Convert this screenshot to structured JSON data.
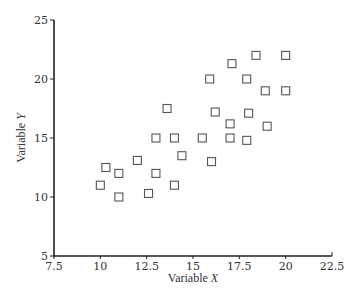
{
  "chart_data": {
    "type": "scatter",
    "title": "",
    "xlabel": "Variable X",
    "xlabel_parts": {
      "prefix": "Variable ",
      "var": "X"
    },
    "ylabel": "Variable Y",
    "ylabel_parts": {
      "prefix": "Variable ",
      "var": "Y"
    },
    "xlim": [
      7.5,
      22.5
    ],
    "ylim": [
      5,
      25
    ],
    "xticks": [
      7.5,
      10,
      12.5,
      15,
      17.5,
      20,
      22.5
    ],
    "xtick_labels": [
      "7.5",
      "10",
      "12.5",
      "15",
      "17.5",
      "20",
      "22.5"
    ],
    "yticks": [
      5,
      10,
      15,
      20,
      25
    ],
    "ytick_labels": [
      "5",
      "10",
      "15",
      "20",
      "25"
    ],
    "grid": false,
    "legend": null,
    "marker": "open-square",
    "series": [
      {
        "name": "observations",
        "points": [
          {
            "x": 10.0,
            "y": 11.0
          },
          {
            "x": 10.3,
            "y": 12.5
          },
          {
            "x": 11.0,
            "y": 12.0
          },
          {
            "x": 11.0,
            "y": 10.0
          },
          {
            "x": 12.0,
            "y": 13.1
          },
          {
            "x": 12.6,
            "y": 10.3
          },
          {
            "x": 13.0,
            "y": 15.0
          },
          {
            "x": 13.0,
            "y": 12.0
          },
          {
            "x": 13.6,
            "y": 17.5
          },
          {
            "x": 14.0,
            "y": 15.0
          },
          {
            "x": 14.0,
            "y": 11.0
          },
          {
            "x": 14.4,
            "y": 13.5
          },
          {
            "x": 15.5,
            "y": 15.0
          },
          {
            "x": 15.9,
            "y": 20.0
          },
          {
            "x": 16.0,
            "y": 13.0
          },
          {
            "x": 16.2,
            "y": 17.2
          },
          {
            "x": 17.0,
            "y": 16.2
          },
          {
            "x": 17.0,
            "y": 15.0
          },
          {
            "x": 17.1,
            "y": 21.3
          },
          {
            "x": 17.9,
            "y": 20.0
          },
          {
            "x": 18.0,
            "y": 17.1
          },
          {
            "x": 17.9,
            "y": 14.8
          },
          {
            "x": 18.4,
            "y": 22.0
          },
          {
            "x": 18.9,
            "y": 19.0
          },
          {
            "x": 19.0,
            "y": 16.0
          },
          {
            "x": 20.0,
            "y": 22.0
          },
          {
            "x": 20.0,
            "y": 19.0
          }
        ]
      }
    ]
  },
  "colors": {
    "axis": "#222222",
    "marker_stroke": "#555555",
    "marker_fill": "#ffffff",
    "text": "#333333"
  }
}
